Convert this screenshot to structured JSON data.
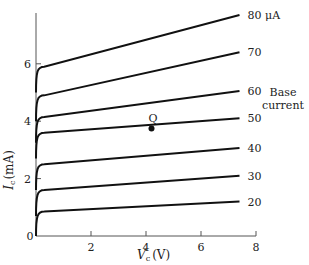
{
  "chart_data": {
    "type": "line",
    "title": "",
    "xlabel": "V_c (V)",
    "ylabel": "I_c (mA)",
    "xlim": [
      0,
      8
    ],
    "ylim": [
      0,
      7.8
    ],
    "x_ticks": [
      0,
      2,
      4,
      6,
      8
    ],
    "y_ticks": [
      0,
      2,
      4,
      6
    ],
    "grid": false,
    "legend_title": [
      "Base",
      "current"
    ],
    "legend_position": "right",
    "series": [
      {
        "name": "80 μA",
        "label": "80",
        "unit": "μA",
        "knee": [
          0.3,
          5.9
        ],
        "end": [
          7.4,
          7.7
        ]
      },
      {
        "name": "70 μA",
        "label": "70",
        "unit": "",
        "knee": [
          0.3,
          4.9
        ],
        "end": [
          7.4,
          6.4
        ]
      },
      {
        "name": "60 μA",
        "label": "60",
        "unit": "",
        "knee": [
          0.3,
          4.15
        ],
        "end": [
          7.4,
          5.05
        ]
      },
      {
        "name": "50 μA",
        "label": "50",
        "unit": "",
        "knee": [
          0.3,
          3.6
        ],
        "end": [
          7.4,
          4.1
        ]
      },
      {
        "name": "40 μA",
        "label": "40",
        "unit": "",
        "knee": [
          0.3,
          2.5
        ],
        "end": [
          7.4,
          3.07
        ]
      },
      {
        "name": "30 μA",
        "label": "30",
        "unit": "",
        "knee": [
          0.3,
          1.6
        ],
        "end": [
          7.4,
          2.1
        ]
      },
      {
        "name": "20 μA",
        "label": "20",
        "unit": "",
        "knee": [
          0.3,
          0.85
        ],
        "end": [
          7.4,
          1.2
        ]
      }
    ],
    "annotations": [
      {
        "label": "Q",
        "x": 4.2,
        "y": 3.75,
        "type": "operating-point"
      }
    ]
  },
  "labels": {
    "y_axis": "I",
    "y_axis_sub": "c",
    "y_axis_unit": "(mA)",
    "x_axis": "V",
    "x_axis_sub": "c",
    "x_axis_unit": "(V)",
    "q_point": "Q",
    "legend_line1": "Base",
    "legend_line2": "current",
    "unit_80": "μA"
  }
}
